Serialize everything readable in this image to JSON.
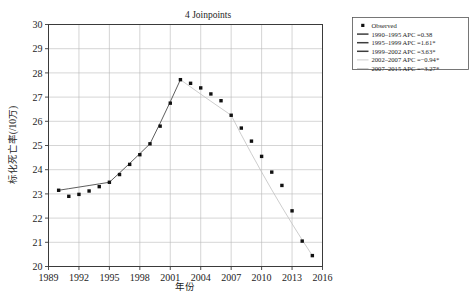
{
  "chart_data": {
    "type": "line",
    "title": "4 Joinpoints",
    "xlabel": "年份",
    "ylabel": "标化死亡率(/10万)",
    "xlim": [
      1989,
      2016
    ],
    "ylim": [
      20,
      30
    ],
    "grid": true,
    "legend_position": "outside-top-right",
    "xticks": [
      "1989",
      "1992",
      "1995",
      "1998",
      "2001",
      "2004",
      "2007",
      "2010",
      "2013",
      "2016"
    ],
    "xtick_values": [
      1989,
      1992,
      1995,
      1998,
      2001,
      2004,
      2007,
      2010,
      2013,
      2016
    ],
    "yticks": [
      "20",
      "21",
      "22",
      "23",
      "24",
      "25",
      "26",
      "27",
      "28",
      "29",
      "30"
    ],
    "ytick_values": [
      20,
      21,
      22,
      23,
      24,
      25,
      26,
      27,
      28,
      29,
      30
    ],
    "x": [
      1990,
      1991,
      1992,
      1993,
      1994,
      1995,
      1996,
      1997,
      1998,
      1999,
      2000,
      2001,
      2002,
      2003,
      2004,
      2005,
      2006,
      2007,
      2008,
      2009,
      2010,
      2011,
      2012,
      2013,
      2014,
      2015
    ],
    "series": [
      {
        "name": "Observed",
        "marker": "square",
        "values": [
          23.15,
          22.9,
          22.98,
          23.12,
          23.3,
          23.48,
          23.8,
          24.22,
          24.62,
          25.07,
          25.8,
          26.75,
          27.72,
          27.57,
          27.38,
          27.13,
          26.85,
          26.25,
          25.72,
          25.18,
          24.55,
          23.9,
          23.35,
          22.3,
          21.05,
          20.45
        ]
      }
    ],
    "joinpoint_segments": [
      {
        "label": "1990–1995 APC =0.38",
        "start": 1990,
        "end": 1995,
        "apc": 0.38,
        "significant": false,
        "style": "solid-dark"
      },
      {
        "label": "1995–1999 APC =1.61*",
        "start": 1995,
        "end": 1999,
        "apc": 1.61,
        "significant": true,
        "style": "solid-dark"
      },
      {
        "label": "1999–2002 APC =3.63*",
        "start": 1999,
        "end": 2002,
        "apc": 3.63,
        "significant": true,
        "style": "solid-dark"
      },
      {
        "label": "2002–2007 APC =−0.94*",
        "start": 2002,
        "end": 2007,
        "apc": -0.94,
        "significant": true,
        "style": "solid-light"
      },
      {
        "label": "2007–2015 APC =−3.27*",
        "start": 2007,
        "end": 2015,
        "apc": -3.27,
        "significant": true,
        "style": "solid-light"
      }
    ],
    "legend_entries": [
      {
        "label": "Observed",
        "type": "marker"
      },
      {
        "label": "1990–1995 APC =0.38",
        "type": "line-dark"
      },
      {
        "label": "1995–1999 APC =1.61*",
        "type": "line-dark"
      },
      {
        "label": "1999–2002 APC =3.63*",
        "type": "line-dark"
      },
      {
        "label": "2002–2007 APC =−0.94*",
        "type": "line-light"
      },
      {
        "label": "2007–2015 APC =−3.27*",
        "type": "line-light"
      }
    ],
    "colors": {
      "marker": "#111111",
      "fit_dark": "#555555",
      "fit_light": "#c0c0c0",
      "grid": "#b9b9b9",
      "frame": "#3a3a3a",
      "background": "#ffffff"
    }
  }
}
